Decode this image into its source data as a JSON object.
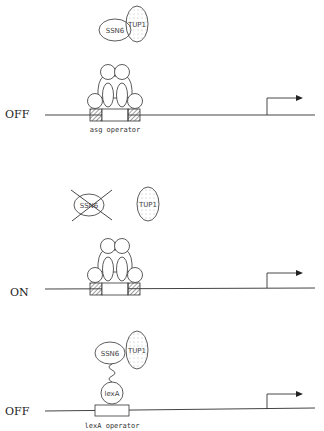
{
  "diagram": {
    "panels": [
      {
        "state": "OFF",
        "operator_label": "asg operator",
        "proteins": [
          "SSN6",
          "TUP1"
        ]
      },
      {
        "state": "ON",
        "proteins": [
          "SSN6",
          "TUP1"
        ],
        "crossed_out": "SSN6"
      },
      {
        "state": "OFF",
        "operator_label": "lexA operator",
        "proteins": [
          "SSN6",
          "TUP1",
          "lexA"
        ]
      }
    ]
  }
}
